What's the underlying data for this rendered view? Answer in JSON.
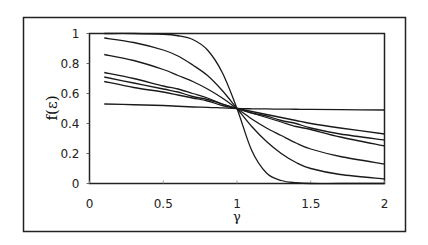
{
  "chart_data": {
    "type": "line",
    "title": "",
    "xlabel": "γ",
    "ylabel": "f(ε)",
    "xlim": [
      0,
      2
    ],
    "ylim": [
      0,
      1
    ],
    "xticks": [
      "0",
      "0.5",
      "1",
      "1.5",
      "2"
    ],
    "xtick_values": [
      0,
      0.5,
      1,
      1.5,
      2
    ],
    "yticks": [
      "0",
      "0.2",
      "0.4",
      "0.6",
      "0.8",
      "1"
    ],
    "ytick_values": [
      0,
      0.2,
      0.4,
      0.6,
      0.8,
      1
    ],
    "grid": false,
    "legend": "none",
    "x": [
      0.1,
      0.3,
      0.5,
      0.6,
      0.7,
      0.8,
      0.9,
      1.0,
      1.1,
      1.2,
      1.3,
      1.4,
      1.5,
      1.7,
      2.0
    ],
    "series": [
      {
        "name": "curve-1",
        "values": [
          1.0,
          1.0,
          0.995,
          0.985,
          0.96,
          0.89,
          0.74,
          0.5,
          0.22,
          0.07,
          0.02,
          0.005,
          0.0,
          0.0,
          0.0
        ]
      },
      {
        "name": "curve-2",
        "values": [
          0.97,
          0.94,
          0.89,
          0.85,
          0.79,
          0.72,
          0.62,
          0.5,
          0.38,
          0.28,
          0.2,
          0.14,
          0.1,
          0.06,
          0.03
        ]
      },
      {
        "name": "curve-3",
        "values": [
          0.86,
          0.82,
          0.76,
          0.72,
          0.68,
          0.63,
          0.57,
          0.5,
          0.43,
          0.37,
          0.32,
          0.27,
          0.23,
          0.18,
          0.13
        ]
      },
      {
        "name": "curve-4",
        "values": [
          0.74,
          0.7,
          0.65,
          0.63,
          0.6,
          0.57,
          0.53,
          0.5,
          0.47,
          0.44,
          0.41,
          0.38,
          0.36,
          0.31,
          0.25
        ]
      },
      {
        "name": "curve-5",
        "values": [
          0.71,
          0.67,
          0.63,
          0.61,
          0.58,
          0.56,
          0.53,
          0.5,
          0.47,
          0.45,
          0.42,
          0.4,
          0.37,
          0.33,
          0.29
        ]
      },
      {
        "name": "curve-6",
        "values": [
          0.68,
          0.64,
          0.61,
          0.59,
          0.57,
          0.55,
          0.52,
          0.5,
          0.48,
          0.46,
          0.44,
          0.42,
          0.4,
          0.37,
          0.33
        ]
      },
      {
        "name": "curve-7",
        "values": [
          0.53,
          0.525,
          0.52,
          0.515,
          0.51,
          0.508,
          0.504,
          0.5,
          0.498,
          0.497,
          0.496,
          0.495,
          0.494,
          0.492,
          0.49
        ]
      }
    ]
  }
}
